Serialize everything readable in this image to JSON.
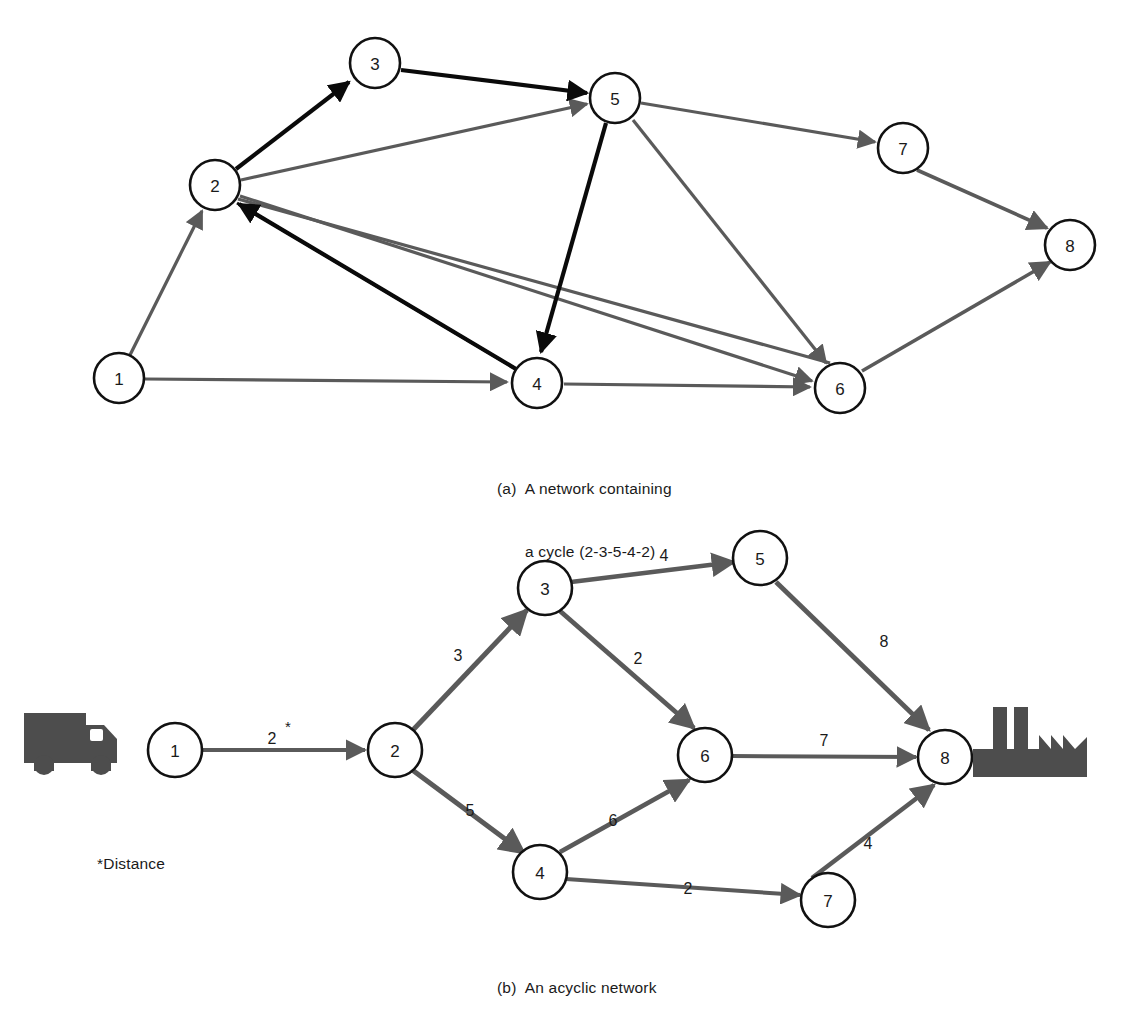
{
  "figure": {
    "panels": [
      {
        "id": "a",
        "caption_line1": "(a)  A network containing",
        "caption_line2": "a cycle (2-3-5-4-2)",
        "node_labels": [
          "1",
          "2",
          "3",
          "4",
          "5",
          "6",
          "7",
          "8"
        ],
        "cycle_description": "2-3-5-4-2",
        "colors": {
          "cycle_edge": "#0a0a0a",
          "normal_edge": "#5a5a5a",
          "node_stroke": "#111111",
          "node_fill": "#ffffff"
        },
        "nodes": [
          {
            "label": "1",
            "x": 119,
            "y": 378
          },
          {
            "label": "2",
            "x": 215,
            "y": 185
          },
          {
            "label": "3",
            "x": 375,
            "y": 63
          },
          {
            "label": "4",
            "x": 537,
            "y": 383
          },
          {
            "label": "5",
            "x": 615,
            "y": 98
          },
          {
            "label": "6",
            "x": 840,
            "y": 388
          },
          {
            "label": "7",
            "x": 903,
            "y": 148
          },
          {
            "label": "8",
            "x": 1070,
            "y": 245
          }
        ],
        "edges": [
          {
            "from": "1",
            "to": "2",
            "style": "normal"
          },
          {
            "from": "1",
            "to": "4",
            "style": "normal"
          },
          {
            "from": "2",
            "to": "3",
            "style": "cycle"
          },
          {
            "from": "3",
            "to": "5",
            "style": "cycle"
          },
          {
            "from": "5",
            "to": "4",
            "style": "cycle"
          },
          {
            "from": "4",
            "to": "2",
            "style": "cycle"
          },
          {
            "from": "2",
            "to": "5",
            "style": "normal"
          },
          {
            "from": "2",
            "to": "6",
            "style": "normal"
          },
          {
            "from": "6",
            "to": "2",
            "style": "normal"
          },
          {
            "from": "5",
            "to": "7",
            "style": "normal"
          },
          {
            "from": "5",
            "to": "6",
            "style": "normal"
          },
          {
            "from": "4",
            "to": "6",
            "style": "normal"
          },
          {
            "from": "7",
            "to": "8",
            "style": "normal"
          },
          {
            "from": "6",
            "to": "8",
            "style": "normal"
          }
        ]
      },
      {
        "id": "b",
        "caption": "(b)  An acyclic network",
        "footnote": "*Distance",
        "source_icon": "truck-icon",
        "sink_icon": "factory-icon",
        "node_labels": [
          "1",
          "2",
          "3",
          "4",
          "5",
          "6",
          "7",
          "8"
        ],
        "colors": {
          "edge": "#5a5a5a",
          "node_stroke": "#111111",
          "node_fill": "#ffffff",
          "icon": "#4d4d4d"
        },
        "nodes": [
          {
            "label": "1",
            "x": 175,
            "y": 750
          },
          {
            "label": "2",
            "x": 395,
            "y": 750
          },
          {
            "label": "3",
            "x": 545,
            "y": 588
          },
          {
            "label": "4",
            "x": 540,
            "y": 872
          },
          {
            "label": "5",
            "x": 760,
            "y": 558
          },
          {
            "label": "6",
            "x": 705,
            "y": 755
          },
          {
            "label": "7",
            "x": 828,
            "y": 900
          },
          {
            "label": "8",
            "x": 945,
            "y": 757
          }
        ],
        "edges": [
          {
            "from": "1",
            "to": "2",
            "weight": "2",
            "marker": "*",
            "lx": 272,
            "ly": 738
          },
          {
            "from": "2",
            "to": "3",
            "weight": "3",
            "lx": 458,
            "ly": 655
          },
          {
            "from": "2",
            "to": "4",
            "weight": "5",
            "lx": 470,
            "ly": 810
          },
          {
            "from": "3",
            "to": "5",
            "weight": "4",
            "lx": 664,
            "ly": 555
          },
          {
            "from": "3",
            "to": "6",
            "weight": "2",
            "lx": 638,
            "ly": 658
          },
          {
            "from": "4",
            "to": "6",
            "weight": "6",
            "lx": 613,
            "ly": 820
          },
          {
            "from": "4",
            "to": "7",
            "weight": "2",
            "lx": 688,
            "ly": 888
          },
          {
            "from": "5",
            "to": "8",
            "weight": "8",
            "lx": 884,
            "ly": 641
          },
          {
            "from": "6",
            "to": "8",
            "weight": "7",
            "lx": 824,
            "ly": 740
          },
          {
            "from": "7",
            "to": "8",
            "weight": "4",
            "lx": 868,
            "ly": 843
          }
        ]
      }
    ]
  }
}
